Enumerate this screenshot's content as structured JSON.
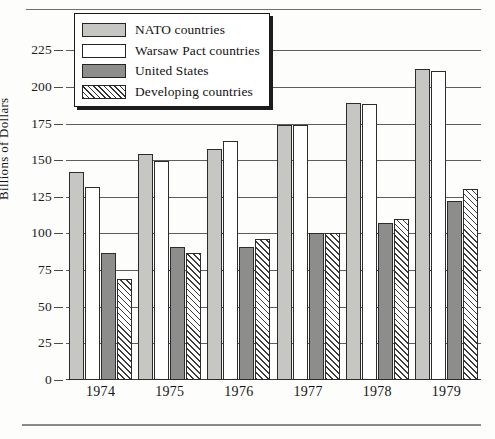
{
  "chart_data": {
    "type": "bar",
    "title": "",
    "subtitle": "",
    "xlabel": "",
    "ylabel": "Billions of Dollars",
    "categories": [
      "1974",
      "1975",
      "1976",
      "1977",
      "1978",
      "1979"
    ],
    "ylim": [
      0,
      232
    ],
    "yticks": [
      0,
      25,
      50,
      75,
      100,
      125,
      150,
      175,
      200,
      225
    ],
    "ytick_labels": [
      "0",
      "25",
      "50",
      "75",
      "100",
      "125",
      "150",
      "175",
      "200",
      "225"
    ],
    "grid": true,
    "grid_axis": "y",
    "legend_position": "upper-left",
    "series": [
      {
        "name": "NATO countries",
        "swatch": "light-gray-solid",
        "color": "#c6c6c3",
        "values": [
          142,
          154,
          157.5,
          174,
          189,
          212
        ]
      },
      {
        "name": "Warsaw Pact countries",
        "swatch": "white-solid",
        "color": "#ffffff",
        "values": [
          132,
          149.5,
          163,
          174,
          188,
          211
        ]
      },
      {
        "name": "United States",
        "swatch": "dark-gray-solid",
        "color": "#8d8d8b",
        "values": [
          87,
          91,
          91,
          100,
          107,
          122
        ]
      },
      {
        "name": "Developing countries",
        "swatch": "diagonal-hatch",
        "color": "#333333",
        "values": [
          69,
          87,
          96,
          100,
          110,
          130
        ]
      }
    ]
  },
  "yaxis": {
    "title": "Billions of Dollars"
  },
  "legend": {
    "entries": [
      {
        "label": "NATO countries",
        "swatch": "nato"
      },
      {
        "label": "Warsaw Pact countries",
        "swatch": "warsaw"
      },
      {
        "label": "United States",
        "swatch": "us"
      },
      {
        "label": "Developing countries",
        "swatch": "dev"
      }
    ]
  }
}
